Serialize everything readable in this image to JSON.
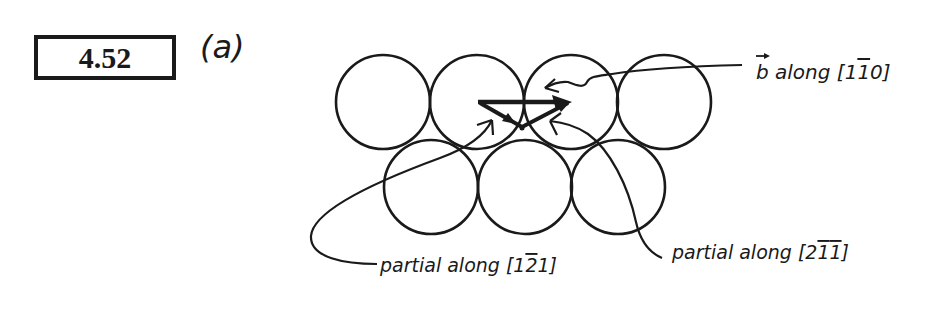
{
  "problem": {
    "number": "4.52",
    "part": "(a)"
  },
  "diagram": {
    "top_row_count": 4,
    "bottom_row_count": 3,
    "labels": {
      "burgers": "b along [1̅1̅0]",
      "burgers_prefix": "b",
      "burgers_text": " along [1",
      "burgers_bar": "1",
      "burgers_end": "0]",
      "partial_left_text": "partial along [1",
      "partial_left_bar": "2",
      "partial_left_end": "1]",
      "partial_right_text": "partial along [2",
      "partial_right_bar1": "1",
      "partial_right_bar2": "1",
      "partial_right_end": "]"
    },
    "stroke_color": "#1a1a1a",
    "background": "#ffffff"
  }
}
